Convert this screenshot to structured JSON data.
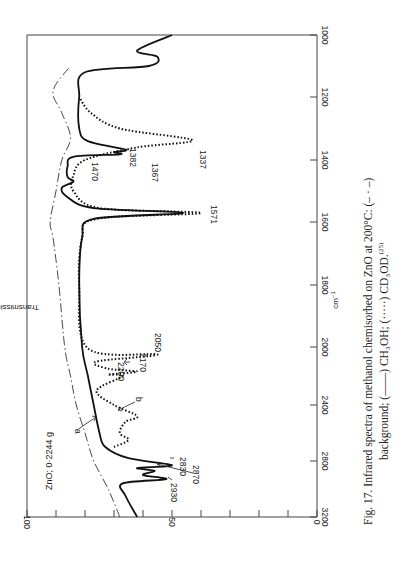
{
  "figure": {
    "caption_line1": "Fig. 17. Infrared spectra of methanol chemisorbed on ZnO at 200°C: (– · –)",
    "caption_line2": "background; (——) CH₃OH; (·····) CD₃OD.",
    "caption_ref": "(25)",
    "sample_label": "ZnO; 0·2244 g",
    "rotation": "90deg clockwise (page printed sideways)"
  },
  "chart_data": {
    "type": "line",
    "title": "Infrared spectra of methanol chemisorbed on ZnO at 200°C",
    "xlabel": "cm⁻¹",
    "ylabel": "Transmission (%)",
    "xlim": [
      3200,
      1000
    ],
    "ylim": [
      0,
      100
    ],
    "x_ticks": [
      3200,
      2800,
      2400,
      2000,
      1800,
      1600,
      1400,
      1200,
      1000
    ],
    "y_ticks": [
      0,
      10,
      20,
      30,
      40,
      50,
      60,
      70,
      80,
      90,
      100
    ],
    "y_tick_labels": [
      "0",
      "50",
      "100"
    ],
    "grid": false,
    "legend": [
      {
        "name": "background",
        "style": "dash-dot"
      },
      {
        "name": "CH3OH",
        "style": "solid"
      },
      {
        "name": "CD3OD",
        "style": "dotted"
      }
    ],
    "series": [
      {
        "name": "background",
        "style": "dash-dot",
        "points": [
          [
            3200,
            68
          ],
          [
            3000,
            72
          ],
          [
            2800,
            77
          ],
          [
            2600,
            80
          ],
          [
            2400,
            83
          ],
          [
            2200,
            85
          ],
          [
            2000,
            87
          ],
          [
            1800,
            89
          ],
          [
            1650,
            91
          ],
          [
            1600,
            92
          ],
          [
            1500,
            90
          ],
          [
            1400,
            88
          ],
          [
            1330,
            85
          ],
          [
            1250,
            88
          ],
          [
            1180,
            91
          ],
          [
            1100,
            85
          ]
        ]
      },
      {
        "name": "CH3OH",
        "style": "solid",
        "points": [
          [
            3200,
            62
          ],
          [
            3050,
            66
          ],
          [
            2960,
            67
          ],
          [
            2930,
            52
          ],
          [
            2900,
            60
          ],
          [
            2870,
            56
          ],
          [
            2850,
            62
          ],
          [
            2830,
            50
          ],
          [
            2780,
            65
          ],
          [
            2700,
            73
          ],
          [
            2600,
            75
          ],
          [
            2400,
            77
          ],
          [
            2200,
            79
          ],
          [
            2000,
            81
          ],
          [
            1800,
            82
          ],
          [
            1650,
            81
          ],
          [
            1590,
            77
          ],
          [
            1571,
            46
          ],
          [
            1555,
            77
          ],
          [
            1520,
            86
          ],
          [
            1490,
            88
          ],
          [
            1470,
            84
          ],
          [
            1455,
            86
          ],
          [
            1420,
            86
          ],
          [
            1390,
            84
          ],
          [
            1382,
            68
          ],
          [
            1375,
            70
          ],
          [
            1367,
            66
          ],
          [
            1340,
            79
          ],
          [
            1300,
            82
          ],
          [
            1200,
            82
          ],
          [
            1120,
            80
          ],
          [
            1100,
            58
          ],
          [
            1070,
            55
          ],
          [
            1050,
            62
          ],
          [
            1000,
            50
          ]
        ]
      },
      {
        "name": "CD3OD",
        "style": "dotted",
        "points": [
          [
            2700,
            70
          ],
          [
            2650,
            65
          ],
          [
            2600,
            68
          ],
          [
            2520,
            66
          ],
          [
            2480,
            62
          ],
          [
            2400,
            70
          ],
          [
            2300,
            76
          ],
          [
            2200,
            67
          ],
          [
            2190,
            72
          ],
          [
            2170,
            62
          ],
          [
            2150,
            72
          ],
          [
            2100,
            76
          ],
          [
            2050,
            55
          ],
          [
            2010,
            79
          ],
          [
            1800,
            82
          ],
          [
            1650,
            81
          ],
          [
            1590,
            76
          ],
          [
            1571,
            40
          ],
          [
            1555,
            75
          ],
          [
            1500,
            84
          ],
          [
            1450,
            84
          ],
          [
            1400,
            80
          ],
          [
            1360,
            62
          ],
          [
            1337,
            43
          ],
          [
            1300,
            68
          ],
          [
            1250,
            78
          ],
          [
            1200,
            82
          ]
        ]
      }
    ],
    "annotations": [
      "1337",
      "1367",
      "1382",
      "1470",
      "1571",
      "2050",
      "2170",
      "2200",
      "2830",
      "2870",
      "2930",
      "a",
      "b",
      "ZnO; 0·2244 g"
    ]
  },
  "axes": {
    "x_ticks": [
      {
        "label": "3200"
      },
      {
        "label": "2800"
      },
      {
        "label": "2400"
      },
      {
        "label": "2000"
      },
      {
        "label": "1800"
      },
      {
        "label": "1600"
      },
      {
        "label": "1400"
      },
      {
        "label": "1200"
      },
      {
        "label": "1000"
      }
    ],
    "y_ticks": [
      {
        "label": "100"
      },
      {
        "label": "50"
      },
      {
        "label": "0"
      }
    ],
    "x_title": "cm",
    "x_title_sup": "−1",
    "y_title": "Transmission (%)"
  },
  "annotations": {
    "p1337": "1337",
    "p1367": "1367",
    "p1382": "1382",
    "p1470": "1470",
    "p1571": "1571",
    "p2050": "2050",
    "p2170": "2170",
    "p2200": "2200",
    "p2830": "2830",
    "p2870": "2870",
    "p2930": "2930",
    "a": "a",
    "b": "b"
  }
}
